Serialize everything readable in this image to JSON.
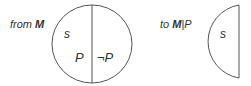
{
  "left_panel": {
    "caption_prefix": "from ",
    "caption_symbol": "M",
    "region_label_s": "s",
    "region_label_p": "P",
    "region_label_not_p": "¬P"
  },
  "right_panel": {
    "caption_prefix": "to ",
    "caption_symbol": "M",
    "caption_separator": "|",
    "caption_condition": "P",
    "region_label_s": "s"
  },
  "colors": {
    "stroke": "#555555",
    "text": "#333333"
  }
}
